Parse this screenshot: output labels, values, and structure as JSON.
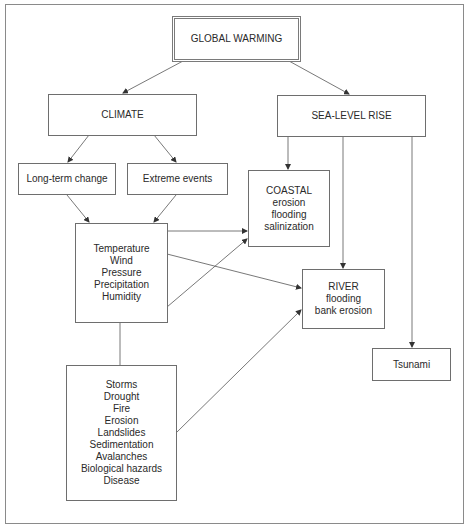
{
  "diagram": {
    "title": "GLOBAL WARMING",
    "nodes": {
      "global_warming": {
        "label": "GLOBAL WARMING"
      },
      "climate": {
        "label": "CLIMATE"
      },
      "sea_level_rise": {
        "label": "SEA-LEVEL RISE"
      },
      "long_term_change": {
        "label": "Long-term change"
      },
      "extreme_events": {
        "label": "Extreme events"
      },
      "coastal": {
        "lines": [
          "COASTAL",
          "erosion",
          "flooding",
          "salinization"
        ]
      },
      "variables": {
        "lines": [
          "Temperature",
          "Wind",
          "Pressure",
          "Precipitation",
          "Humidity"
        ]
      },
      "river": {
        "lines": [
          "RIVER",
          "flooding",
          "bank erosion"
        ]
      },
      "tsunami": {
        "label": "Tsunami"
      },
      "hazards": {
        "lines": [
          "Storms",
          "Drought",
          "Fire",
          "Erosion",
          "Landslides",
          "Sedimentation",
          "Avalanches",
          "Biological hazards",
          "Disease"
        ]
      }
    },
    "edges": [
      {
        "from": "global_warming",
        "to": "climate",
        "arrow": true
      },
      {
        "from": "global_warming",
        "to": "sea_level_rise",
        "arrow": true
      },
      {
        "from": "climate",
        "to": "long_term_change",
        "arrow": true
      },
      {
        "from": "climate",
        "to": "extreme_events",
        "arrow": true
      },
      {
        "from": "long_term_change",
        "to": "variables",
        "arrow": true
      },
      {
        "from": "extreme_events",
        "to": "variables",
        "arrow": true
      },
      {
        "from": "sea_level_rise",
        "to": "coastal",
        "arrow": true
      },
      {
        "from": "sea_level_rise",
        "to": "river",
        "arrow": true
      },
      {
        "from": "sea_level_rise",
        "to": "tsunami",
        "arrow": true
      },
      {
        "from": "variables",
        "to": "coastal",
        "arrow": true
      },
      {
        "from": "variables",
        "to": "coastal",
        "arrow": true
      },
      {
        "from": "variables",
        "to": "river",
        "arrow": true
      },
      {
        "from": "variables",
        "to": "hazards",
        "arrow": false
      },
      {
        "from": "hazards",
        "to": "river",
        "arrow": true
      }
    ]
  }
}
